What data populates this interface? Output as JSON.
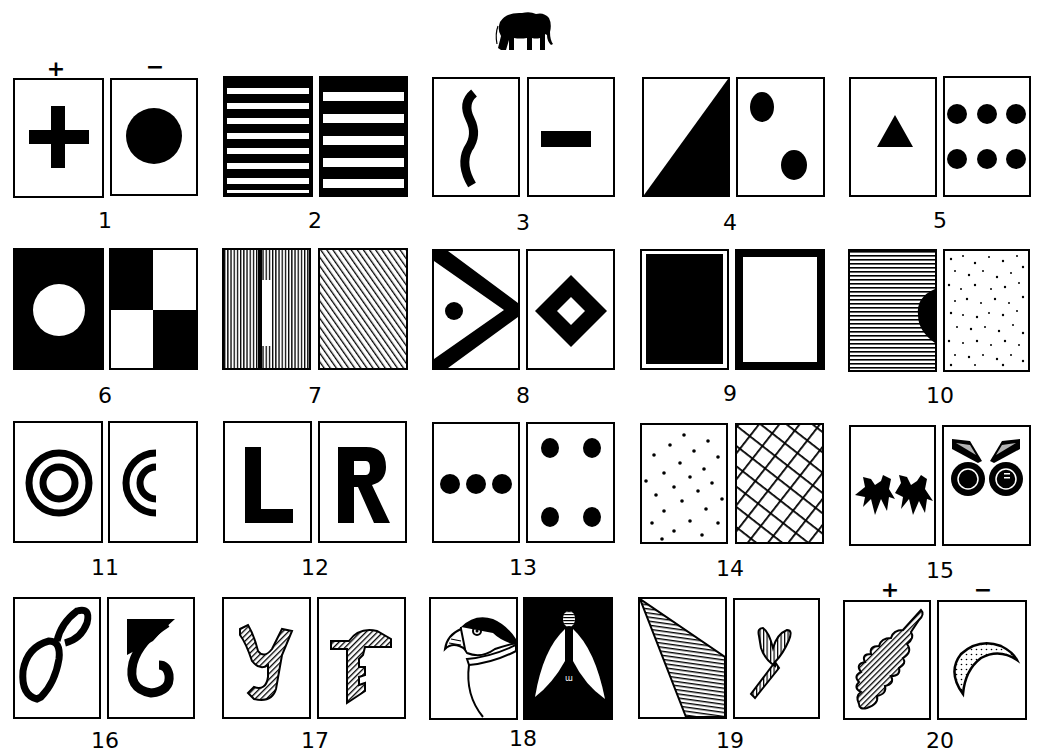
{
  "figure": {
    "header_icon": "elephant-silhouette",
    "sign_plus": "+",
    "sign_minus": "−",
    "pairs": [
      {
        "number": "1",
        "left": "plus-cross",
        "right": "filled-circle",
        "left_sign": "+",
        "right_sign": "−"
      },
      {
        "number": "2",
        "left": "narrow-horizontal-stripes",
        "right": "wide-horizontal-stripes"
      },
      {
        "number": "3",
        "left": "wavy-vertical-line",
        "right": "horizontal-bar"
      },
      {
        "number": "4",
        "left": "diagonal-half-black",
        "right": "two-diagonal-dots"
      },
      {
        "number": "5",
        "left": "triangle",
        "right": "six-dots"
      },
      {
        "number": "6",
        "left": "white-circle-on-black",
        "right": "checkerboard-2x2"
      },
      {
        "number": "7",
        "left": "vertical-lines-with-white-bar",
        "right": "diagonal-hatching"
      },
      {
        "number": "8",
        "left": "chevron-with-dot",
        "right": "hollow-diamond"
      },
      {
        "number": "9",
        "left": "black-rectangle",
        "right": "thick-black-frame"
      },
      {
        "number": "10",
        "left": "horizontal-lines-with-half-disc",
        "right": "random-dots"
      },
      {
        "number": "11",
        "left": "concentric-rings",
        "right": "concentric-half-rings"
      },
      {
        "number": "12",
        "left": "L",
        "right": "R"
      },
      {
        "number": "13",
        "left": "three-dots-row",
        "right": "four-dots-corners"
      },
      {
        "number": "14",
        "left": "sparse-dots",
        "right": "diagonal-lattice"
      },
      {
        "number": "15",
        "left": "two-claw-shapes",
        "right": "owl-eyes"
      },
      {
        "number": "16",
        "left": "figure-eight-outline",
        "right": "hook-shape"
      },
      {
        "number": "17",
        "left": "hatched-y-glyph",
        "right": "hatched-t-glyph"
      },
      {
        "number": "18",
        "left": "puffin-head",
        "right": "snowdrop-flower"
      },
      {
        "number": "19",
        "left": "hatched-triangle",
        "right": "hatched-y-sprout"
      },
      {
        "number": "20",
        "left": "hatched-oak-leaf",
        "right": "dotted-crescent",
        "left_sign": "+",
        "right_sign": "−"
      }
    ]
  }
}
